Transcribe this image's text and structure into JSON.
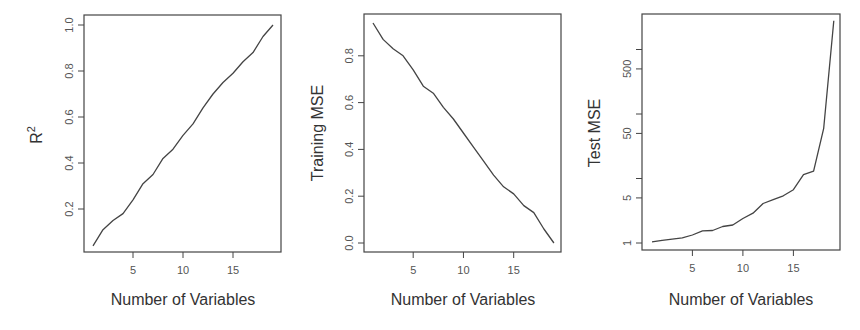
{
  "chart_data": [
    {
      "type": "line",
      "title": "",
      "xlabel": "Number of Variables",
      "ylabel": "R^2",
      "ylabel_main": "R",
      "ylabel_sup": "2",
      "x": [
        1,
        2,
        3,
        4,
        5,
        6,
        7,
        8,
        9,
        10,
        11,
        12,
        13,
        14,
        15,
        16,
        17,
        18,
        19
      ],
      "values": [
        0.04,
        0.11,
        0.15,
        0.18,
        0.24,
        0.31,
        0.35,
        0.42,
        0.46,
        0.52,
        0.57,
        0.64,
        0.7,
        0.75,
        0.79,
        0.84,
        0.88,
        0.95,
        1.0
      ],
      "xticks": [
        5,
        10,
        15
      ],
      "yticks": [
        0.2,
        0.4,
        0.6,
        0.8,
        1.0
      ],
      "ytick_labels": [
        "0.2",
        "0.4",
        "0.6",
        "0.8",
        "1.0"
      ],
      "xlim": [
        0.3,
        19.7
      ],
      "ylim": [
        -0.01,
        1.04
      ],
      "yscale": "linear",
      "grid": false
    },
    {
      "type": "line",
      "title": "",
      "xlabel": "Number of Variables",
      "ylabel": "Training MSE",
      "x": [
        1,
        2,
        3,
        4,
        5,
        6,
        7,
        8,
        9,
        10,
        11,
        12,
        13,
        14,
        15,
        16,
        17,
        18,
        19
      ],
      "values": [
        0.94,
        0.87,
        0.83,
        0.8,
        0.74,
        0.67,
        0.64,
        0.58,
        0.53,
        0.47,
        0.41,
        0.35,
        0.29,
        0.24,
        0.21,
        0.16,
        0.13,
        0.06,
        0.0
      ],
      "xticks": [
        5,
        10,
        15
      ],
      "yticks": [
        0.0,
        0.2,
        0.4,
        0.6,
        0.8
      ],
      "ytick_labels": [
        "0.0",
        "0.2",
        "0.4",
        "0.6",
        "0.8"
      ],
      "xlim": [
        0.3,
        19.7
      ],
      "ylim": [
        -0.04,
        0.98
      ],
      "yscale": "linear",
      "grid": false
    },
    {
      "type": "line",
      "title": "",
      "xlabel": "Number of Variables",
      "ylabel": "Test MSE",
      "x": [
        1,
        2,
        3,
        4,
        5,
        6,
        7,
        8,
        9,
        10,
        11,
        12,
        13,
        14,
        15,
        16,
        17,
        18,
        19
      ],
      "values": [
        1.04,
        1.1,
        1.15,
        1.2,
        1.33,
        1.54,
        1.56,
        1.8,
        1.9,
        2.4,
        2.9,
        4.1,
        4.7,
        5.4,
        6.7,
        11.5,
        13,
        60,
        2800
      ],
      "xticks": [
        5,
        10,
        15
      ],
      "yticks": [
        1,
        5,
        10,
        50,
        100,
        500,
        1000
      ],
      "ytick_labels": [
        "1",
        "5",
        "",
        "50",
        "",
        "500",
        ""
      ],
      "xlim": [
        0.3,
        19.7
      ],
      "ylim": [
        0.9,
        4000
      ],
      "yscale": "log",
      "grid": false
    }
  ]
}
